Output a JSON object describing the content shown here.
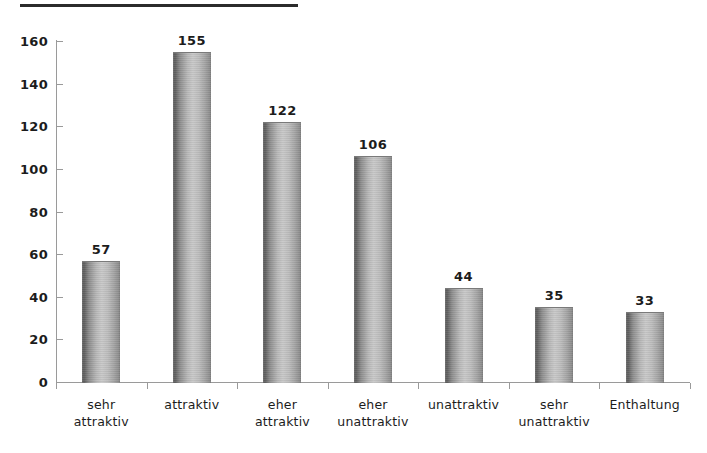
{
  "decoration": {
    "top_rule_name": "top-horizontal-rule"
  },
  "chart_data": {
    "type": "bar",
    "title": "",
    "subtitle": "",
    "xlabel": "",
    "ylabel": "",
    "categories": [
      "sehr attraktiv",
      "attraktiv",
      "eher attraktiv",
      "eher unattraktiv",
      "unattraktiv",
      "sehr unattraktiv",
      "Enthaltung"
    ],
    "category_lines": [
      [
        "sehr",
        "attraktiv"
      ],
      [
        "attraktiv",
        ""
      ],
      [
        "eher",
        "attraktiv"
      ],
      [
        "eher",
        "unattraktiv"
      ],
      [
        "unattraktiv",
        ""
      ],
      [
        "sehr",
        "unattraktiv"
      ],
      [
        "Enthaltung",
        ""
      ]
    ],
    "values": [
      57,
      155,
      122,
      106,
      44,
      35,
      33
    ],
    "value_labels": [
      "57",
      "155",
      "122",
      "106",
      "44",
      "35",
      "33"
    ],
    "ylim": [
      0,
      160
    ],
    "ytick_values": [
      0,
      20,
      40,
      60,
      80,
      100,
      120,
      140,
      160
    ],
    "ytick_labels": [
      "0",
      "20",
      "40",
      "60",
      "80",
      "100",
      "120",
      "140",
      "160"
    ],
    "grid": false,
    "legend": false,
    "legend_position": "none",
    "bar_style": "cylinder",
    "colors": {
      "bar_dark": "#5d5d5d",
      "bar_light": "#c9c9c9",
      "axis": "#9a9a9a",
      "text": "#1c1c1c",
      "rule": "#2b2b2b",
      "background": "#ffffff"
    }
  }
}
